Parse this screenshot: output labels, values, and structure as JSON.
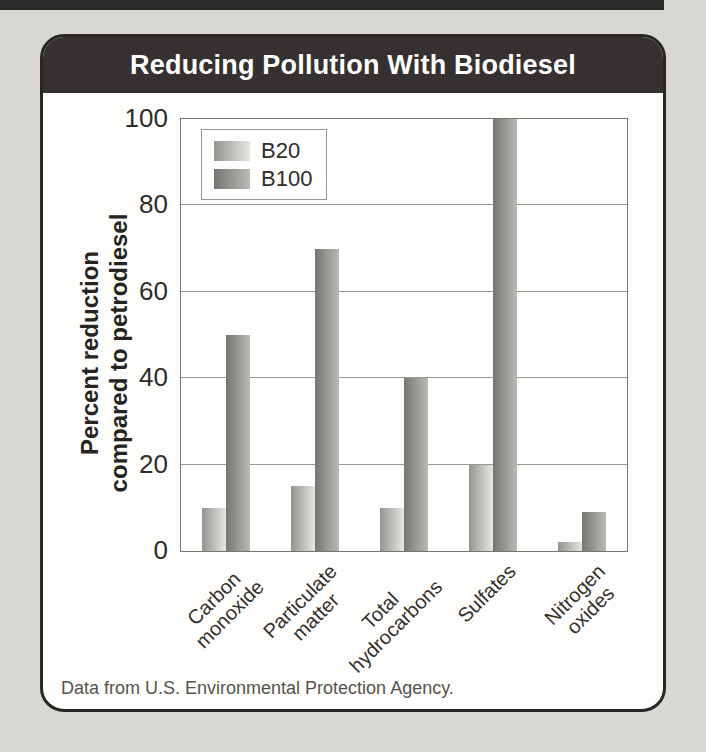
{
  "page": {
    "background_color": "#d8d7d3",
    "top_strip_color": "#2b2a28"
  },
  "card": {
    "title": "Reducing Pollution With Biodiesel",
    "header_color": "#343130",
    "border_color": "#282624",
    "footer": "Data from U.S. Environmental Protection Agency."
  },
  "chart_data": {
    "type": "bar",
    "title": "Reducing Pollution With Biodiesel",
    "xlabel": "",
    "ylabel": "Percent reduction\ncompared to petrodiesel",
    "categories": [
      "Carbon\nmonoxide",
      "Particulate\nmatter",
      "Total\nhydrocarbons",
      "Sulfates",
      "Nitrogen\noxides"
    ],
    "series": [
      {
        "name": "B20",
        "values": [
          10,
          15,
          10,
          20,
          2
        ],
        "color_stops": [
          "#96948f",
          "#e7e6e2"
        ]
      },
      {
        "name": "B100",
        "values": [
          50,
          70,
          40,
          100,
          9
        ],
        "color_stops": [
          "#777571",
          "#bbb9b4"
        ]
      }
    ],
    "ylim": [
      0,
      100
    ],
    "yticks": [
      0,
      20,
      40,
      60,
      80,
      100
    ],
    "grid": true,
    "legend_position": "top-left",
    "source": "Data from U.S. Environmental Protection Agency."
  }
}
